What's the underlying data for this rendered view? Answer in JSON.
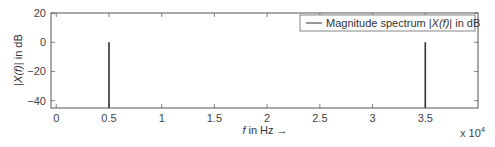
{
  "chart_data": {
    "type": "line",
    "subtype": "stem",
    "title": "",
    "xlabel": "f in Hz →",
    "xlabel_parts": {
      "italic": "f",
      "rest": " in Hz →"
    },
    "ylabel": "|X(f)| in dB",
    "ylabel_parts": {
      "pre": "|",
      "italic": "X(f)",
      "post": "| in dB"
    },
    "x_multiplier": "x 10^4",
    "x_multiplier_parts": {
      "base": "x 10",
      "exp": "4"
    },
    "xlim": [
      -0.05,
      4.0
    ],
    "ylim": [
      -45,
      20
    ],
    "xticks": [
      0,
      0.5,
      1,
      1.5,
      2,
      2.5,
      3,
      3.5
    ],
    "xtick_labels": [
      "0",
      "0.5",
      "1",
      "1.5",
      "2",
      "2.5",
      "3",
      "3.5"
    ],
    "yticks": [
      20,
      0,
      -20,
      -40
    ],
    "ytick_labels": [
      "20",
      "0",
      "-20",
      "-40"
    ],
    "grid": false,
    "legend_position": "upper right",
    "series": [
      {
        "name": "Magnitude spectrum |X(f)| in dB",
        "color": "#333333",
        "x": [
          0.5,
          3.5
        ],
        "values": [
          0,
          0
        ],
        "baseline": -45
      }
    ]
  },
  "legend": {
    "label_pre": "Magnitude spectrum |",
    "label_italic": "X(f)",
    "label_post": "| in dB"
  }
}
